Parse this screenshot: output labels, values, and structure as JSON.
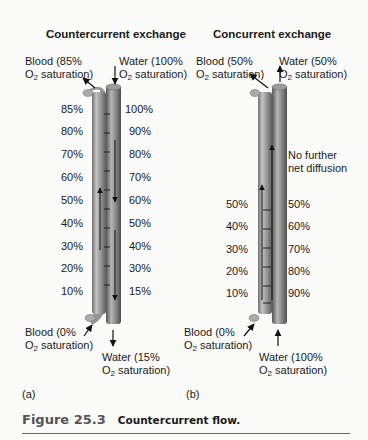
{
  "panels": [
    {
      "id": "a",
      "title": "Countercurrent exchange",
      "letter": "(a)",
      "blood_in": {
        "line1": "Blood (0%",
        "line2_pre": "O",
        "line2_sub": "2",
        "line2_post": " saturation)"
      },
      "blood_out": {
        "line1": "Blood (85%",
        "line2_pre": "O",
        "line2_sub": "2",
        "line2_post": " saturation)"
      },
      "water_in": {
        "line1": "Water (100%",
        "line2_pre": "O",
        "line2_sub": "2",
        "line2_post": " saturation)"
      },
      "water_out": {
        "line1": "Water (15%",
        "line2_pre": "O",
        "line2_sub": "2",
        "line2_post": " saturation)"
      },
      "blood_percentages": [
        "85%",
        "80%",
        "70%",
        "60%",
        "50%",
        "40%",
        "30%",
        "20%",
        "10%"
      ],
      "water_percentages": [
        "100%",
        "90%",
        "80%",
        "70%",
        "60%",
        "50%",
        "40%",
        "30%",
        "15%"
      ]
    },
    {
      "id": "b",
      "title": "Concurrent exchange",
      "letter": "(b)",
      "blood_in": {
        "line1": "Blood (0%",
        "line2_pre": "O",
        "line2_sub": "2",
        "line2_post": " saturation)"
      },
      "blood_out": {
        "line1": "Blood (50%",
        "line2_pre": "O",
        "line2_sub": "2",
        "line2_post": " saturation)"
      },
      "water_in": {
        "line1": "Water (100%",
        "line2_pre": "O",
        "line2_sub": "2",
        "line2_post": " saturation)"
      },
      "water_out": {
        "line1": "Water (50%",
        "line2_pre": "O",
        "line2_sub": "2",
        "line2_post": " saturation)"
      },
      "note": {
        "line1": "No further",
        "line2": "net diffusion"
      },
      "blood_percentages": [
        "50%",
        "40%",
        "30%",
        "20%",
        "10%"
      ],
      "water_percentages": [
        "50%",
        "60%",
        "70%",
        "80%",
        "90%"
      ]
    }
  ],
  "caption": {
    "figure_number": "Figure 25.3",
    "text": "Countercurrent flow."
  },
  "colors": {
    "background": "#fbfbfa",
    "vessel_light": "#b8b8b8",
    "vessel_dark": "#6e6e6e",
    "arrow": "#111111",
    "rule": "#666666"
  }
}
